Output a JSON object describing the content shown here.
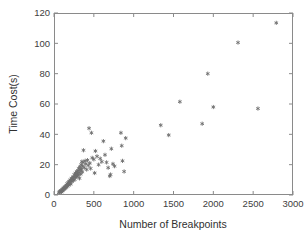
{
  "chart_data": {
    "type": "scatter",
    "title": "",
    "xlabel": "Number of Breakpoints",
    "ylabel": "Time Cost(s)",
    "xlim": [
      0,
      3000
    ],
    "ylim": [
      0,
      120
    ],
    "xticks": [
      0,
      500,
      1000,
      1500,
      2000,
      2500,
      3000
    ],
    "yticks": [
      0,
      20,
      40,
      60,
      80,
      100,
      120
    ],
    "xticklabels": [
      "0",
      "500",
      "1000",
      "1500",
      "2000",
      "2500",
      "3000"
    ],
    "yticklabels": [
      "0",
      "20",
      "40",
      "60",
      "80",
      "100",
      "120"
    ],
    "grid": false,
    "legend": null,
    "marker": "asterisk",
    "marker_color": "#6e6e6e",
    "series": [
      {
        "name": "Time Cost vs Breakpoints",
        "points": [
          [
            60,
            1.5
          ],
          [
            70,
            2.0
          ],
          [
            75,
            2.5
          ],
          [
            85,
            2.2
          ],
          [
            90,
            3.0
          ],
          [
            95,
            2.0
          ],
          [
            100,
            3.5
          ],
          [
            105,
            2.8
          ],
          [
            110,
            4.0
          ],
          [
            115,
            3.2
          ],
          [
            120,
            4.5
          ],
          [
            125,
            3.8
          ],
          [
            130,
            5.0
          ],
          [
            135,
            4.2
          ],
          [
            140,
            5.5
          ],
          [
            145,
            4.8
          ],
          [
            150,
            6.0
          ],
          [
            155,
            5.2
          ],
          [
            160,
            6.5
          ],
          [
            165,
            7.5
          ],
          [
            170,
            5.8
          ],
          [
            175,
            7.0
          ],
          [
            180,
            8.2
          ],
          [
            185,
            6.5
          ],
          [
            190,
            9.0
          ],
          [
            195,
            7.8
          ],
          [
            200,
            8.5
          ],
          [
            205,
            10.0
          ],
          [
            210,
            7.2
          ],
          [
            215,
            9.5
          ],
          [
            220,
            11.0
          ],
          [
            225,
            8.8
          ],
          [
            230,
            10.5
          ],
          [
            240,
            12.0
          ],
          [
            245,
            9.8
          ],
          [
            250,
            11.5
          ],
          [
            255,
            13.5
          ],
          [
            260,
            10.2
          ],
          [
            265,
            12.5
          ],
          [
            270,
            14.5
          ],
          [
            275,
            11.8
          ],
          [
            280,
            13.0
          ],
          [
            285,
            15.5
          ],
          [
            290,
            12.2
          ],
          [
            295,
            14.0
          ],
          [
            300,
            16.0
          ],
          [
            305,
            13.2
          ],
          [
            310,
            17.5
          ],
          [
            315,
            15.0
          ],
          [
            320,
            11.0
          ],
          [
            325,
            18.5
          ],
          [
            330,
            16.5
          ],
          [
            335,
            13.8
          ],
          [
            340,
            20.0
          ],
          [
            345,
            17.0
          ],
          [
            350,
            22.0
          ],
          [
            355,
            15.2
          ],
          [
            360,
            19.0
          ],
          [
            365,
            21.5
          ],
          [
            370,
            29.5
          ],
          [
            380,
            18.0
          ],
          [
            390,
            22.5
          ],
          [
            400,
            20.5
          ],
          [
            410,
            16.8
          ],
          [
            420,
            23.0
          ],
          [
            430,
            19.5
          ],
          [
            440,
            44.0
          ],
          [
            450,
            21.0
          ],
          [
            460,
            17.5
          ],
          [
            470,
            41.0
          ],
          [
            480,
            24.5
          ],
          [
            500,
            23.5
          ],
          [
            510,
            14.5
          ],
          [
            520,
            29.0
          ],
          [
            540,
            25.5
          ],
          [
            560,
            20.0
          ],
          [
            580,
            24.0
          ],
          [
            600,
            22.0
          ],
          [
            620,
            35.5
          ],
          [
            640,
            26.5
          ],
          [
            660,
            21.5
          ],
          [
            680,
            18.0
          ],
          [
            700,
            12.5
          ],
          [
            710,
            13.5
          ],
          [
            720,
            30.5
          ],
          [
            740,
            20.5
          ],
          [
            760,
            19.0
          ],
          [
            840,
            41.0
          ],
          [
            850,
            32.5
          ],
          [
            860,
            22.5
          ],
          [
            880,
            15.5
          ],
          [
            900,
            37.5
          ],
          [
            1340,
            46.0
          ],
          [
            1440,
            39.5
          ],
          [
            1580,
            61.5
          ],
          [
            1860,
            47.0
          ],
          [
            1930,
            80.0
          ],
          [
            2000,
            58.0
          ],
          [
            2310,
            100.5
          ],
          [
            2560,
            57.0
          ],
          [
            2790,
            113.5
          ]
        ]
      }
    ]
  },
  "axes": {
    "plot_box": {
      "left": 54,
      "top": 13,
      "right": 293,
      "bottom": 195
    }
  }
}
